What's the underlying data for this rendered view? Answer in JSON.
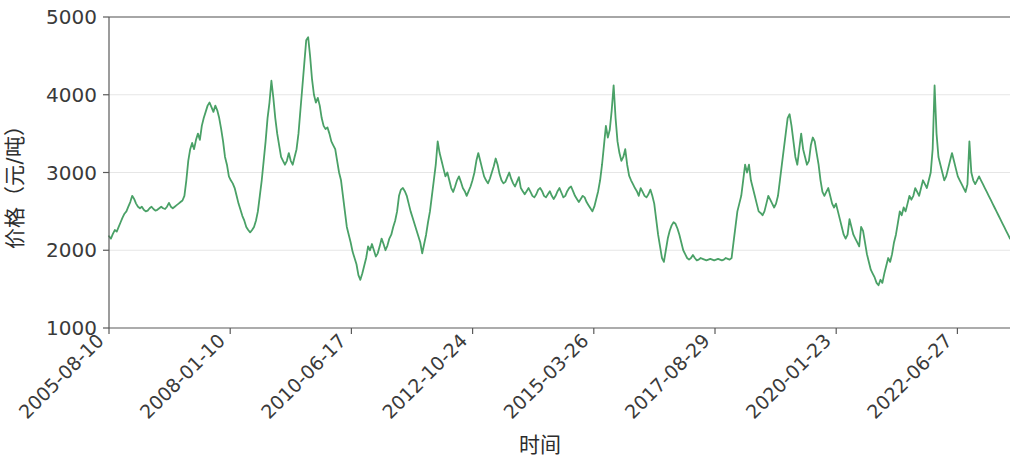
{
  "chart_data": {
    "type": "line",
    "title": "",
    "xlabel": "时间",
    "ylabel": "价格（元/吨）",
    "ylim": [
      1000,
      5000
    ],
    "yticks": [
      1000,
      2000,
      3000,
      4000,
      5000
    ],
    "ytick_labels": [
      "1000",
      "2000",
      "3000",
      "4000",
      "5000"
    ],
    "xtick_labels": [
      "2005-08-10",
      "2008-01-10",
      "2010-06-17",
      "2012-10-24",
      "2015-03-26",
      "2017-08-29",
      "2020-01-23",
      "2022-06-27"
    ],
    "xtick_rotation_deg": 45,
    "grid": "horizontal",
    "legend": "none",
    "series": [
      {
        "name": "价格",
        "color": "#4aa167",
        "line_width": 1.8,
        "x_index": [
          0,
          1,
          2,
          3,
          4,
          5,
          6,
          7,
          8,
          9,
          10,
          11,
          12,
          13,
          14,
          15,
          16,
          17,
          18,
          19,
          20,
          21,
          22,
          23,
          24,
          25,
          26,
          27,
          28,
          29,
          30,
          31,
          32,
          33,
          34,
          35,
          36,
          37,
          38,
          39,
          40,
          41,
          42,
          43,
          44,
          45,
          46,
          47,
          48,
          49,
          50,
          51,
          52,
          53,
          54,
          55,
          56,
          57,
          58,
          59,
          60,
          61,
          62,
          63,
          64,
          65,
          66,
          67,
          68,
          69,
          70,
          71,
          72,
          73,
          74,
          75,
          76,
          77,
          78,
          79,
          80,
          81,
          82,
          83,
          84,
          85,
          86,
          87,
          88,
          89,
          90,
          91,
          92,
          93,
          94,
          95,
          96,
          97,
          98,
          99,
          100,
          101,
          102,
          103,
          104,
          105,
          106,
          107,
          108,
          109,
          110,
          111,
          112,
          113,
          114,
          115,
          116,
          117,
          118,
          119,
          120,
          121,
          122,
          123,
          124,
          125,
          126,
          127,
          128,
          129,
          130,
          131,
          132,
          133,
          134,
          135,
          136,
          137,
          138,
          139,
          140,
          141,
          142,
          143,
          144,
          145,
          146,
          147,
          148,
          149,
          150,
          151,
          152,
          153,
          154,
          155,
          156,
          157,
          158,
          159,
          160,
          161,
          162,
          163,
          164,
          165,
          166,
          167,
          168,
          169,
          170,
          171,
          172,
          173,
          174,
          175,
          176,
          177,
          178,
          179,
          180,
          181,
          182,
          183,
          184,
          185,
          186,
          187,
          188,
          189,
          190,
          191,
          192,
          193,
          194,
          195,
          196,
          197,
          198,
          199,
          200,
          201,
          202,
          203,
          204,
          205,
          206,
          207,
          208,
          209,
          210,
          211,
          212,
          213,
          214,
          215,
          216,
          217,
          218,
          219,
          220,
          221,
          222,
          223,
          224,
          225,
          226,
          227,
          228,
          229,
          230,
          231,
          232,
          233,
          234,
          235,
          236,
          237,
          238,
          239,
          240,
          241,
          242,
          243,
          244,
          245,
          246,
          247,
          248,
          249,
          250,
          251,
          252,
          253,
          254,
          255,
          256,
          257,
          258,
          259,
          260,
          261,
          262,
          263,
          264,
          265,
          266,
          267,
          268,
          269,
          270,
          271,
          272,
          273,
          274,
          275,
          276,
          277,
          278,
          279,
          280,
          281,
          282,
          283,
          284,
          285,
          286,
          287,
          288,
          289,
          290,
          291,
          292,
          293,
          294,
          295,
          296,
          297,
          298,
          299,
          300,
          301,
          302,
          303,
          304,
          305,
          306,
          307,
          308,
          309,
          310,
          311,
          312,
          313,
          314,
          315,
          316,
          317,
          318,
          319,
          320,
          321,
          322,
          323,
          324,
          325,
          326,
          327,
          328,
          329,
          330,
          331,
          332,
          333,
          334,
          335,
          336,
          337,
          338,
          339,
          340,
          341,
          342,
          343,
          344,
          345,
          346,
          347,
          348,
          349,
          350,
          351,
          352,
          353,
          354,
          355,
          356,
          357,
          358,
          359
        ],
        "values": [
          2180,
          2150,
          2210,
          2260,
          2240,
          2300,
          2360,
          2420,
          2470,
          2500,
          2560,
          2620,
          2700,
          2660,
          2600,
          2560,
          2540,
          2560,
          2520,
          2500,
          2510,
          2540,
          2560,
          2530,
          2510,
          2520,
          2540,
          2560,
          2540,
          2530,
          2560,
          2610,
          2560,
          2540,
          2560,
          2580,
          2600,
          2620,
          2640,
          2700,
          2900,
          3150,
          3300,
          3380,
          3300,
          3420,
          3500,
          3420,
          3600,
          3700,
          3780,
          3860,
          3900,
          3840,
          3780,
          3860,
          3800,
          3700,
          3560,
          3400,
          3200,
          3100,
          2950,
          2900,
          2860,
          2800,
          2700,
          2600,
          2520,
          2440,
          2380,
          2300,
          2260,
          2230,
          2260,
          2300,
          2380,
          2500,
          2700,
          2900,
          3150,
          3400,
          3700,
          3900,
          4180,
          3960,
          3700,
          3500,
          3350,
          3200,
          3150,
          3100,
          3150,
          3250,
          3150,
          3100,
          3200,
          3300,
          3500,
          3800,
          4100,
          4400,
          4700,
          4740,
          4500,
          4200,
          4000,
          3900,
          3960,
          3860,
          3700,
          3600,
          3560,
          3580,
          3500,
          3400,
          3350,
          3300,
          3150,
          3000,
          2900,
          2700,
          2500,
          2300,
          2200,
          2100,
          1980,
          1900,
          1820,
          1680,
          1620,
          1700,
          1800,
          1900,
          2050,
          2000,
          2080,
          2000,
          1920,
          1960,
          2050,
          2150,
          2080,
          2000,
          2060,
          2150,
          2200,
          2300,
          2380,
          2500,
          2700,
          2780,
          2800,
          2760,
          2700,
          2600,
          2500,
          2420,
          2340,
          2260,
          2180,
          2100,
          1960,
          2080,
          2200,
          2360,
          2500,
          2700,
          2900,
          3100,
          3400,
          3250,
          3150,
          3050,
          2950,
          3000,
          2900,
          2800,
          2750,
          2820,
          2900,
          2950,
          2880,
          2800,
          2760,
          2700,
          2760,
          2820,
          2900,
          3000,
          3150,
          3250,
          3150,
          3050,
          2950,
          2900,
          2860,
          2920,
          3000,
          3080,
          3180,
          3100,
          2980,
          2900,
          2860,
          2880,
          2940,
          3000,
          2920,
          2860,
          2820,
          2880,
          2940,
          2800,
          2760,
          2720,
          2760,
          2800,
          2750,
          2700,
          2680,
          2720,
          2780,
          2800,
          2760,
          2700,
          2680,
          2720,
          2760,
          2700,
          2660,
          2700,
          2760,
          2800,
          2740,
          2680,
          2700,
          2760,
          2800,
          2820,
          2760,
          2700,
          2660,
          2620,
          2660,
          2700,
          2680,
          2620,
          2580,
          2540,
          2500,
          2560,
          2660,
          2760,
          2900,
          3100,
          3350,
          3600,
          3450,
          3550,
          3800,
          4120,
          3700,
          3400,
          3250,
          3150,
          3200,
          3300,
          3100,
          2960,
          2900,
          2850,
          2800,
          2760,
          2700,
          2800,
          2750,
          2700,
          2680,
          2720,
          2780,
          2700,
          2600,
          2400,
          2200,
          2050,
          1900,
          1850,
          2000,
          2150,
          2250,
          2320,
          2360,
          2340,
          2280,
          2200,
          2100,
          2000,
          1950,
          1900,
          1880,
          1900,
          1940,
          1900,
          1870,
          1880,
          1900,
          1890,
          1880,
          1870,
          1880,
          1890,
          1880,
          1870,
          1880,
          1890,
          1880,
          1870,
          1880,
          1900,
          1890,
          1880,
          1900,
          2100,
          2300,
          2500,
          2600,
          2700,
          2900,
          3100,
          3000,
          3100,
          2900,
          2800,
          2700,
          2600,
          2500,
          2480,
          2450,
          2500,
          2600,
          2700,
          2650,
          2600,
          2550,
          2600,
          2700,
          2900,
          3100,
          3300,
          3500,
          3700,
          3750,
          3600,
          3400,
          3200,
          3100,
          3300,
          3500,
          3300,
          3200,
          3100,
          3150,
          3350,
          3450,
          3400,
          3250,
          3100,
          2900,
          2750,
          2700,
          2750,
          2800,
          2700,
          2600,
          2550,
          2600,
          2500,
          2400,
          2300,
          2200,
          2150,
          2200,
          2400,
          2300,
          2200,
          2150,
          2100,
          2050,
          2300,
          2250,
          2100,
          1950,
          1850,
          1750,
          1700,
          1650,
          1580,
          1550,
          1620,
          1580,
          1700,
          1800,
          1900,
          1850,
          1950,
          2100,
          2200,
          2350,
          2500,
          2450,
          2550,
          2500,
          2600,
          2700,
          2650,
          2700,
          2800,
          2750,
          2700,
          2800,
          2900,
          2850,
          2800,
          2900,
          3000,
          3300,
          4120,
          3500,
          3200,
          3100,
          3000,
          2900,
          2950,
          3050,
          3150,
          3250,
          3150,
          3050,
          2950,
          2900,
          2850,
          2800,
          2750,
          2850,
          3400,
          3000,
          2900,
          2850,
          2900,
          2950,
          2900,
          2850,
          2800,
          2750,
          2700,
          2650,
          2600,
          2550,
          2500,
          2450,
          2400,
          2350,
          2300,
          2250,
          2200,
          2150
        ]
      }
    ]
  },
  "axis": {
    "ylabel": "价格（元/吨）",
    "xlabel": "时间"
  }
}
